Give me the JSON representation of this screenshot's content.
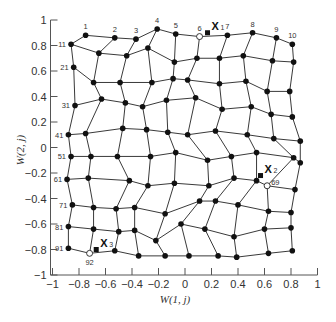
{
  "chart_data": {
    "type": "scatter",
    "title": "",
    "xlabel": "W(1, j)",
    "ylabel": "W(2, j)",
    "xlim": [
      -1,
      1
    ],
    "ylim": [
      -1,
      1
    ],
    "grid": false,
    "x_ticks": [
      "-1",
      "-0.8",
      "-0.6",
      "-0.4",
      "-0.2",
      "0",
      "0.2",
      "0.4",
      "0.6",
      "0.8",
      "1"
    ],
    "y_ticks": [
      "1",
      "0.8",
      "0.6",
      "0.4",
      "0.2",
      "0",
      "-0.2",
      "-0.4",
      "-0.6",
      "-0.8",
      "-1"
    ],
    "grid_shape": [
      10,
      10
    ],
    "node_labels": [
      {
        "index": 1,
        "text": "1"
      },
      {
        "index": 2,
        "text": "2"
      },
      {
        "index": 3,
        "text": "3"
      },
      {
        "index": 4,
        "text": "4"
      },
      {
        "index": 5,
        "text": "5"
      },
      {
        "index": 6,
        "text": "6"
      },
      {
        "index": 7,
        "text": "7"
      },
      {
        "index": 8,
        "text": "8"
      },
      {
        "index": 9,
        "text": "9"
      },
      {
        "index": 10,
        "text": "10"
      },
      {
        "index": 11,
        "text": "11"
      },
      {
        "index": 21,
        "text": "21"
      },
      {
        "index": 31,
        "text": "31"
      },
      {
        "index": 41,
        "text": "41"
      },
      {
        "index": 51,
        "text": "51"
      },
      {
        "index": 61,
        "text": "61"
      },
      {
        "index": 71,
        "text": "71"
      },
      {
        "index": 81,
        "text": "81"
      },
      {
        "index": 91,
        "text": "91"
      },
      {
        "index": 92,
        "text": "92"
      },
      {
        "index": 69,
        "text": "69"
      }
    ],
    "highlighted_nodes": [
      6,
      69,
      92
    ],
    "inputs": [
      {
        "name": "X",
        "sub": "1",
        "x": 0.17,
        "y": 0.9
      },
      {
        "name": "X",
        "sub": "2",
        "x": 0.57,
        "y": -0.22
      },
      {
        "name": "X",
        "sub": "3",
        "x": -0.67,
        "y": -0.8
      }
    ],
    "nodes": [
      [
        -0.75,
        0.88
      ],
      [
        -0.53,
        0.86
      ],
      [
        -0.37,
        0.85
      ],
      [
        -0.21,
        0.93
      ],
      [
        -0.07,
        0.89
      ],
      [
        0.11,
        0.87
      ],
      [
        0.32,
        0.88
      ],
      [
        0.51,
        0.9
      ],
      [
        0.69,
        0.86
      ],
      [
        0.81,
        0.81
      ],
      [
        -0.86,
        0.81
      ],
      [
        -0.65,
        0.74
      ],
      [
        -0.44,
        0.72
      ],
      [
        -0.28,
        0.78
      ],
      [
        -0.08,
        0.67
      ],
      [
        0.09,
        0.7
      ],
      [
        0.26,
        0.7
      ],
      [
        0.44,
        0.72
      ],
      [
        0.66,
        0.68
      ],
      [
        0.82,
        0.67
      ],
      [
        -0.84,
        0.63
      ],
      [
        -0.69,
        0.51
      ],
      [
        -0.49,
        0.51
      ],
      [
        -0.25,
        0.51
      ],
      [
        -0.09,
        0.54
      ],
      [
        0.02,
        0.53
      ],
      [
        0.26,
        0.5
      ],
      [
        0.46,
        0.52
      ],
      [
        0.62,
        0.44
      ],
      [
        0.79,
        0.44
      ],
      [
        -0.83,
        0.33
      ],
      [
        -0.63,
        0.38
      ],
      [
        -0.45,
        0.35
      ],
      [
        -0.32,
        0.32
      ],
      [
        -0.14,
        0.37
      ],
      [
        0.08,
        0.39
      ],
      [
        0.28,
        0.3
      ],
      [
        0.5,
        0.32
      ],
      [
        0.65,
        0.26
      ],
      [
        0.81,
        0.24
      ],
      [
        -0.88,
        0.1
      ],
      [
        -0.75,
        0.11
      ],
      [
        -0.47,
        0.15
      ],
      [
        -0.29,
        0.14
      ],
      [
        -0.13,
        0.12
      ],
      [
        0.02,
        0.1
      ],
      [
        0.23,
        0.13
      ],
      [
        0.47,
        0.1
      ],
      [
        0.67,
        0.07
      ],
      [
        0.87,
        0.05
      ],
      [
        -0.86,
        -0.07
      ],
      [
        -0.71,
        -0.07
      ],
      [
        -0.51,
        -0.07
      ],
      [
        -0.26,
        -0.07
      ],
      [
        -0.07,
        -0.04
      ],
      [
        0.17,
        -0.1
      ],
      [
        0.35,
        -0.07
      ],
      [
        0.54,
        -0.04
      ],
      [
        0.82,
        -0.08
      ],
      [
        0.87,
        -0.12
      ],
      [
        -0.89,
        -0.25
      ],
      [
        -0.73,
        -0.24
      ],
      [
        -0.42,
        -0.26
      ],
      [
        -0.28,
        -0.3
      ],
      [
        -0.08,
        -0.28
      ],
      [
        0.18,
        -0.3
      ],
      [
        0.37,
        -0.24
      ],
      [
        0.54,
        -0.26
      ],
      [
        0.62,
        -0.3
      ],
      [
        0.83,
        -0.33
      ],
      [
        -0.85,
        -0.45
      ],
      [
        -0.69,
        -0.47
      ],
      [
        -0.52,
        -0.48
      ],
      [
        -0.38,
        -0.47
      ],
      [
        -0.15,
        -0.52
      ],
      [
        0.11,
        -0.42
      ],
      [
        0.23,
        -0.42
      ],
      [
        0.4,
        -0.45
      ],
      [
        0.63,
        -0.5
      ],
      [
        0.8,
        -0.51
      ],
      [
        -0.88,
        -0.62
      ],
      [
        -0.69,
        -0.64
      ],
      [
        -0.5,
        -0.66
      ],
      [
        -0.38,
        -0.65
      ],
      [
        -0.22,
        -0.73
      ],
      [
        -0.03,
        -0.6
      ],
      [
        0.15,
        -0.64
      ],
      [
        0.37,
        -0.7
      ],
      [
        0.6,
        -0.64
      ],
      [
        0.8,
        -0.63
      ],
      [
        -0.88,
        -0.79
      ],
      [
        -0.72,
        -0.83
      ],
      [
        -0.53,
        -0.81
      ],
      [
        -0.35,
        -0.85
      ],
      [
        -0.15,
        -0.85
      ],
      [
        0.03,
        -0.85
      ],
      [
        0.25,
        -0.85
      ],
      [
        0.39,
        -0.86
      ],
      [
        0.63,
        -0.83
      ],
      [
        0.81,
        -0.81
      ]
    ]
  },
  "axes": {
    "xlabel": "W(1, j)",
    "ylabel": "W(2, j)"
  }
}
